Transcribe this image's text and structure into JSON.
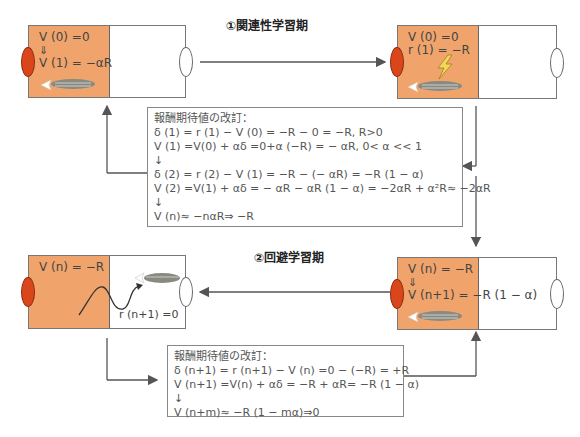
{
  "phase1": {
    "title": "①関連性学習期",
    "tank_left": {
      "line1": "V (0) =0",
      "arrow": "⇓",
      "line2": "V (1) = −αR"
    },
    "tank_right": {
      "line1": "V (0) =0",
      "line2": "r  (1) = −R"
    },
    "eq_box": {
      "heading": "報酬期待値の改訂：",
      "lines": [
        "δ (1) = r (1) − V (0) = −R − 0 = −R, R>0",
        "V (1) =V(0) + αδ =0+α (−R) = − αR, 0< α << 1",
        "↓",
        "δ (2) = r (2) − V (1) = −R − (− αR) = −R (1 − α)",
        "V (2) =V(1) + αδ = − αR − αR (1 − α) = −2αR + α²R≈ −2αR",
        "↓",
        "V (n)≈ −nαR⇒ −R"
      ]
    }
  },
  "phase2": {
    "title": "②回避学習期",
    "tank_left": {
      "line1": "V (n) = −R",
      "reward": "r (n+1) =0"
    },
    "tank_right": {
      "line1": "V (n) = −R",
      "arrow": "⇓",
      "line2": "V (n+1) = −R (1 − α)"
    },
    "eq_box": {
      "heading": "報酬期待値の改訂：",
      "lines": [
        "δ (n+1) = r (n+1) − V (n) =0 − (−R) = +R",
        "V (n+1) =V(n) + αδ = −R + αR= −R (1 − α)",
        "↓",
        "V (n+m)≈ −R (1 − mα)⇒0"
      ]
    }
  },
  "colors": {
    "dark_side": "#f0a46c",
    "dark_light": "#d9461c",
    "lines": "#555555"
  }
}
